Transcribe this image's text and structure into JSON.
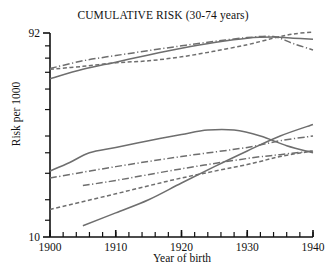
{
  "chart_data": {
    "type": "line",
    "title": "CUMULATIVE RISK (30-74 years)",
    "xlabel": "Year of birth",
    "ylabel": "Risk per 1000",
    "xlim": [
      1900,
      1940
    ],
    "ylim": [
      10,
      92
    ],
    "yscale": "log",
    "grid": false,
    "legend": "none",
    "xticks": [
      1900,
      1910,
      1920,
      1930,
      1940
    ],
    "xticklabels": [
      "1900",
      "1910",
      "1920",
      "1930",
      "1940"
    ],
    "xminor_tick_step": 2,
    "yticks": [
      10,
      92
    ],
    "yticklabels": [
      "10",
      "92"
    ],
    "x": [
      1900,
      1905,
      1910,
      1915,
      1920,
      1925,
      1930,
      1935,
      1940
    ],
    "series": [
      {
        "name": "upper-dashdot",
        "style": "dashdot",
        "color": "#6e6e6e",
        "x": [
          1900,
          1905,
          1910,
          1915,
          1920,
          1925,
          1930,
          1934,
          1937,
          1940
        ],
        "values": [
          62.5,
          68.0,
          72.0,
          76.0,
          80.0,
          84.0,
          87.5,
          88.5,
          82.0,
          76.5
        ]
      },
      {
        "name": "upper-solid",
        "style": "solid",
        "color": "#6e6e6e",
        "x": [
          1900,
          1905,
          1910,
          1915,
          1920,
          1925,
          1930,
          1934,
          1937,
          1940
        ],
        "values": [
          56.0,
          62.0,
          67.0,
          72.5,
          78.0,
          83.0,
          87.0,
          88.0,
          87.0,
          86.0
        ]
      },
      {
        "name": "upper-dashed",
        "style": "dashed",
        "color": "#6e6e6e",
        "x": [
          1900,
          1905,
          1910,
          1915,
          1920,
          1925,
          1930,
          1934,
          1937,
          1940
        ],
        "values": [
          62.0,
          64.0,
          66.5,
          68.0,
          71.0,
          75.5,
          81.0,
          87.0,
          91.0,
          93.0
        ]
      },
      {
        "name": "lower-solid-curve",
        "style": "solid",
        "color": "#6e6e6e",
        "x": [
          1900,
          1903,
          1906,
          1910,
          1915,
          1920,
          1924,
          1928,
          1932,
          1936,
          1940
        ],
        "values": [
          20.5,
          22.5,
          25.0,
          26.5,
          28.5,
          30.5,
          32.0,
          32.0,
          30.0,
          27.0,
          25.0
        ]
      },
      {
        "name": "lower-dashdot-upper",
        "style": "dashdot",
        "color": "#6e6e6e",
        "x": [
          1900,
          1910,
          1920,
          1930,
          1935,
          1940
        ],
        "values": [
          19.0,
          21.5,
          24.0,
          26.5,
          28.5,
          30.0
        ]
      },
      {
        "name": "lower-dashdot-lower",
        "style": "dashdot",
        "color": "#6e6e6e",
        "x": [
          1905,
          1910,
          1920,
          1930,
          1935,
          1940
        ],
        "values": [
          17.5,
          18.5,
          21.0,
          23.5,
          24.5,
          25.5
        ]
      },
      {
        "name": "lower-dashed",
        "style": "dashed",
        "color": "#6e6e6e",
        "x": [
          1900,
          1910,
          1920,
          1930,
          1935,
          1940
        ],
        "values": [
          13.5,
          16.0,
          19.0,
          22.0,
          24.0,
          25.5
        ]
      },
      {
        "name": "lower-solid-steep",
        "style": "solid",
        "color": "#6e6e6e",
        "x": [
          1905,
          1910,
          1915,
          1920,
          1925,
          1930,
          1935,
          1940
        ],
        "values": [
          11.3,
          13.0,
          15.0,
          18.0,
          21.5,
          25.5,
          30.0,
          34.0
        ]
      }
    ]
  },
  "axes": {
    "y_top_label": "92",
    "y_bottom_label": "10"
  }
}
